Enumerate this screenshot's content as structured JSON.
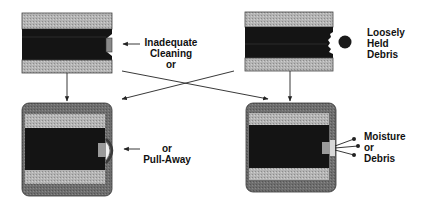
{
  "diagram": {
    "type": "failure-mode-diagram",
    "labels": {
      "inadequate_cleaning": [
        "Inadequate",
        "Cleaning",
        "or"
      ],
      "loosely_held_debris": [
        "Loosely",
        "Held",
        "Debris"
      ],
      "pull_away": [
        "or",
        "Pull-Away"
      ],
      "moisture_or_debris": [
        "Moisture",
        "or",
        "Debris"
      ]
    },
    "colors": {
      "band_gray": "#a8a8a8",
      "core_black": "#141414",
      "coating_gray": "#6a6a6a",
      "line": "#222222",
      "background": "#ffffff"
    },
    "nodes": [
      {
        "id": "top-left",
        "description": "cross-section with notch and residual plug"
      },
      {
        "id": "top-right",
        "description": "cross-section with jagged notch and debris particle"
      },
      {
        "id": "bottom-left",
        "description": "coated cross-section with coating pull-away bulge"
      },
      {
        "id": "bottom-right",
        "description": "coated cross-section with moisture or debris escaping"
      }
    ],
    "edges": [
      {
        "from": "top-left",
        "to": "bottom-left"
      },
      {
        "from": "top-left",
        "to": "bottom-right"
      },
      {
        "from": "top-right",
        "to": "bottom-left"
      },
      {
        "from": "top-right",
        "to": "bottom-right"
      }
    ]
  }
}
